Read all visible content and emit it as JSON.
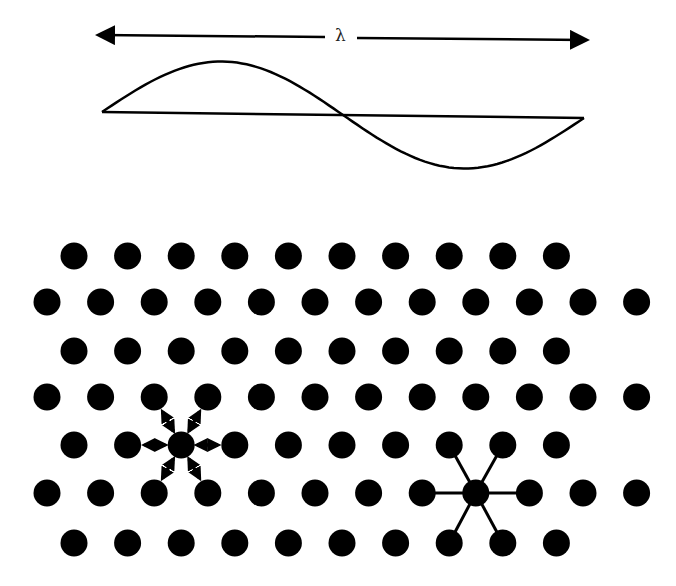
{
  "wave": {
    "label": "λ",
    "arrow_left_x": 100,
    "arrow_right_x": 585,
    "arrow_y": 37,
    "baseline_y": 113,
    "amplitude": 52,
    "x_start": 102,
    "x_end": 584
  },
  "lattice": {
    "dot_radius": 13.5,
    "rows": [
      {
        "y": 256,
        "x0": 74,
        "count": 10
      },
      {
        "y": 302,
        "x0": 47,
        "count": 12
      },
      {
        "y": 351,
        "x0": 74,
        "count": 10
      },
      {
        "y": 397,
        "x0": 47,
        "count": 12
      },
      {
        "y": 445,
        "x0": 74,
        "count": 10
      },
      {
        "y": 493,
        "x0": 47,
        "count": 12
      },
      {
        "y": 543,
        "x0": 74,
        "count": 10
      }
    ],
    "dx": 53.6,
    "vibrating_atom": {
      "row": 4,
      "index": 2,
      "description": "atom with double-headed arrows to six neighbours"
    },
    "bonded_atom": {
      "row": 5,
      "index": 8,
      "description": "atom with bonds to six neighbours"
    }
  },
  "colors": {
    "ink": "#000000",
    "background": "#ffffff"
  }
}
